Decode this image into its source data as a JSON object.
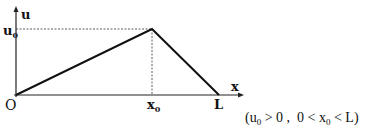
{
  "diagram": {
    "axes": {
      "y_label": "u",
      "x_label": "x",
      "origin_label": "O"
    },
    "peak": {
      "x_label_main": "x",
      "x_label_sub": "0",
      "y_label_main": "u",
      "y_label_sub": "0"
    },
    "end_label": "L",
    "condition": {
      "open": "(",
      "u": "u",
      "u_sub": "0",
      "part1": " > 0 ,  0 < ",
      "x": "x",
      "x_sub": "0",
      "part2": " < L)"
    }
  }
}
